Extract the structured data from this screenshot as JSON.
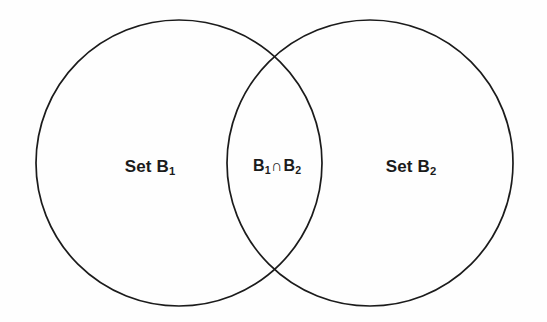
{
  "figure": {
    "type": "venn-diagram",
    "set_count": 2,
    "background_color": "#fefefe",
    "stroke_color": "#1b1b1b",
    "stroke_width": 1.7,
    "text_color": "#1b1b1b"
  },
  "circles": [
    {
      "id": "left-circle",
      "name": "Set B1",
      "cx": 179,
      "cy": 163,
      "r": 143,
      "fill": "none"
    },
    {
      "id": "right-circle",
      "name": "Set B2",
      "cx": 370,
      "cy": 163,
      "r": 143,
      "fill": "none"
    }
  ],
  "labels": {
    "left": {
      "prefix": "Set B",
      "subscript": "1",
      "full_text": "Set B1",
      "x": 150,
      "y": 166
    },
    "intersection": {
      "first_letter": "B",
      "first_subscript": "1",
      "operator": "∩",
      "second_letter": "B",
      "second_subscript": "2",
      "full_text": "B1∩B2",
      "x": 277,
      "y": 166
    },
    "right": {
      "prefix": "Set B",
      "subscript": "2",
      "full_text": "Set B2",
      "x": 411,
      "y": 166
    }
  },
  "chart_data": {
    "type": "venn",
    "title": "",
    "sets": [
      {
        "label": "Set B1",
        "region": "left-only"
      },
      {
        "label": "Set B2",
        "region": "right-only"
      }
    ],
    "intersections": [
      {
        "label": "B1∩B2",
        "members": [
          "Set B1",
          "Set B2"
        ],
        "region": "overlap"
      }
    ],
    "legend": "none",
    "grid": false
  }
}
